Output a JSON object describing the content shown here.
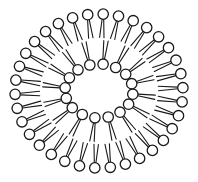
{
  "diagram": {
    "type": "liposome-cross-section",
    "colors": {
      "stroke": "#1a1a1a",
      "head_fill": "#ffffff",
      "background": "#ffffff"
    },
    "center": [
      99,
      91
    ],
    "outer_leaflet": {
      "count": 34,
      "rx": 84,
      "ry": 77,
      "head_radius": 5.2,
      "tail_length": 0.42
    },
    "inner_leaflet": {
      "count": 16,
      "rx": 34,
      "ry": 27,
      "head_radius": 5.2,
      "tail_length": 0.55
    },
    "mid_plane": {
      "rx": 58,
      "ry": 52
    }
  }
}
